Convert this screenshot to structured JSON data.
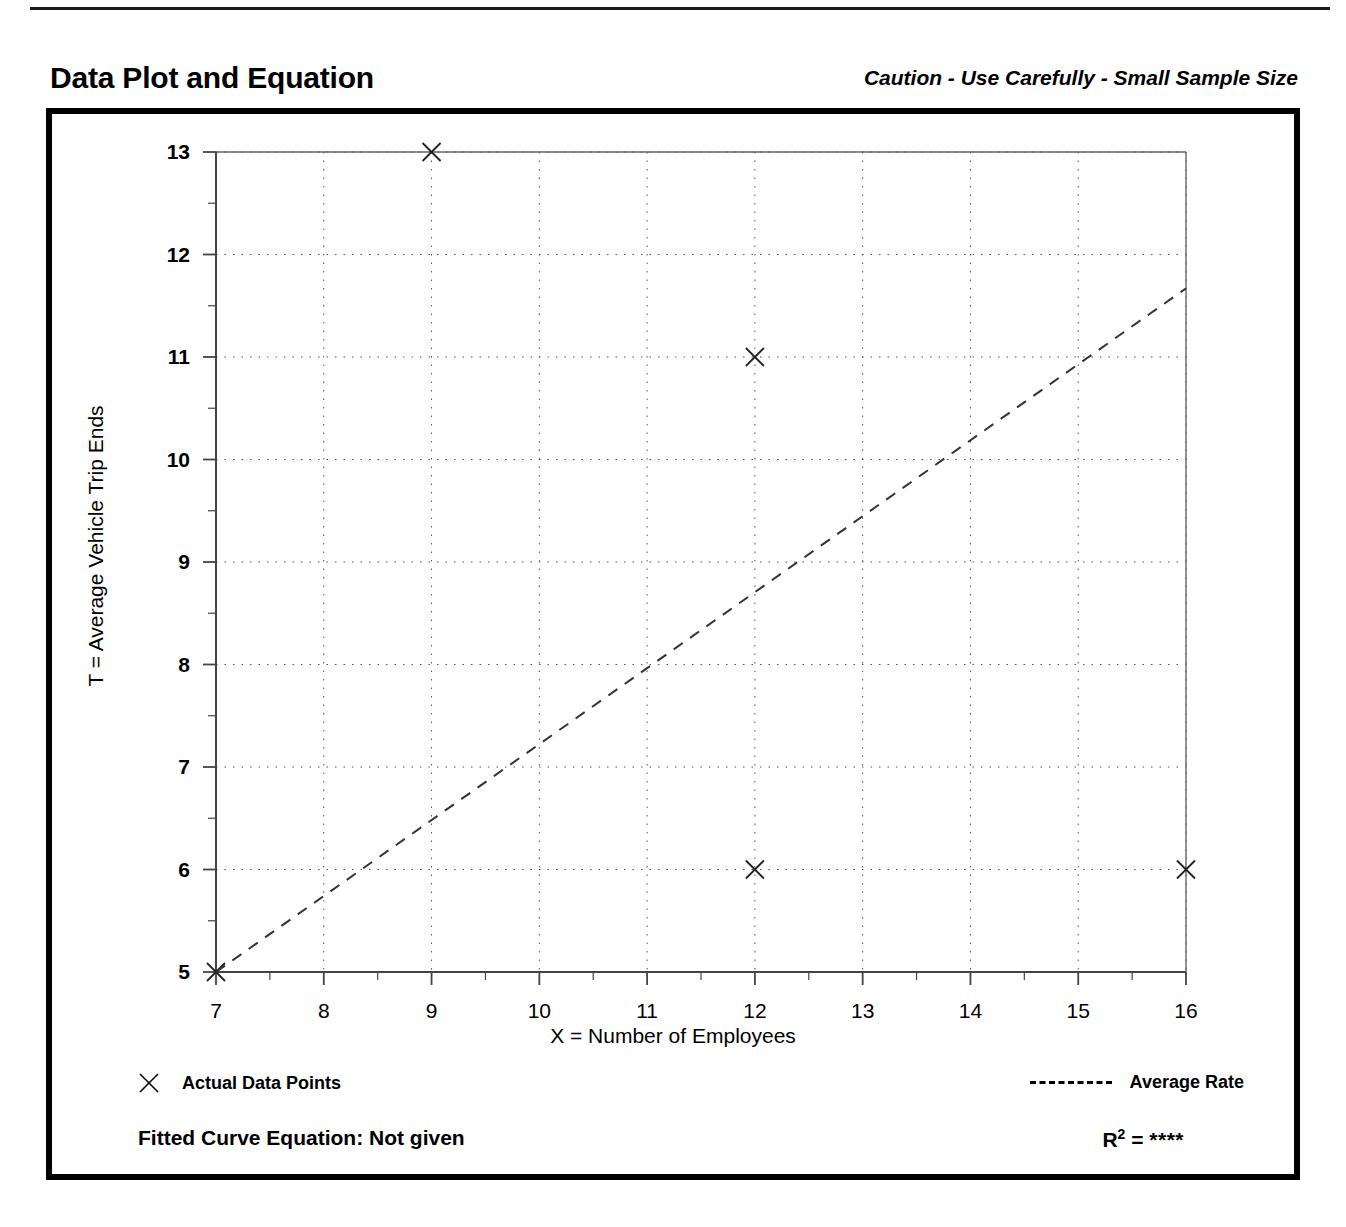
{
  "header": {
    "title": "Data Plot and Equation",
    "caution": "Caution - Use Carefully - Small Sample Size"
  },
  "legend": {
    "data_points_label": "Actual Data Points",
    "average_rate_label": "Average Rate",
    "marker_icon": "x-marker-icon",
    "line_icon": "dashed-line-icon"
  },
  "footer": {
    "fitted_curve_label": "Fitted Curve Equation:  Not given",
    "r2_label": "R",
    "r2_exponent": "2",
    "r2_equals": " = ",
    "r2_value": "****"
  },
  "chart_data": {
    "type": "scatter",
    "title": "Data Plot and Equation",
    "xlabel": "X = Number of Employees",
    "ylabel": "T = Average Vehicle Trip Ends",
    "xlim": [
      7,
      16
    ],
    "ylim": [
      5,
      13
    ],
    "xticks": [
      7,
      8,
      9,
      10,
      11,
      12,
      13,
      14,
      15,
      16
    ],
    "yticks": [
      5,
      6,
      7,
      8,
      9,
      10,
      11,
      12,
      13
    ],
    "xminor_step": 0.5,
    "yminor_step": 0.5,
    "grid": true,
    "grid_style": "dotted",
    "legend_position": "below-axes",
    "series": [
      {
        "name": "Actual Data Points",
        "type": "scatter",
        "marker": "x",
        "points": [
          {
            "x": 7,
            "y": 5
          },
          {
            "x": 9,
            "y": 13
          },
          {
            "x": 12,
            "y": 11
          },
          {
            "x": 12,
            "y": 6
          },
          {
            "x": 16,
            "y": 6
          }
        ]
      },
      {
        "name": "Average Rate",
        "type": "line",
        "style": "dashed",
        "points": [
          {
            "x": 7,
            "y": 5
          },
          {
            "x": 16,
            "y": 11.67
          }
        ]
      }
    ],
    "annotations": {
      "caution": "Caution - Use Carefully - Small Sample Size",
      "fitted_curve_equation": "Not given",
      "r_squared": "****"
    }
  }
}
